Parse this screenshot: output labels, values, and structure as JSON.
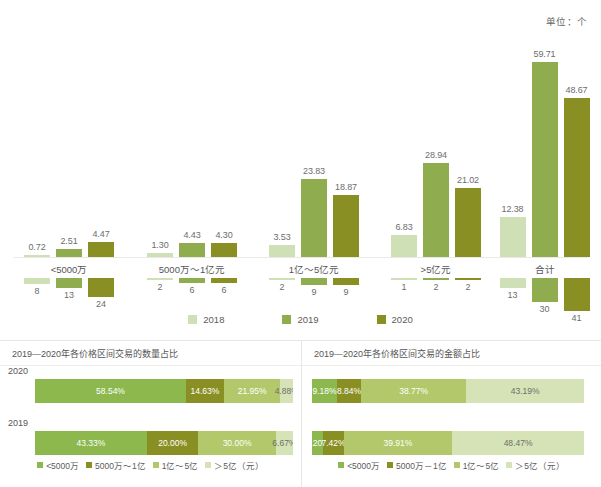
{
  "colors": {
    "c2018": "#cfdfb6",
    "c2019": "#8fad4e",
    "c2020": "#8a8f23",
    "seg_lt5000": "#8cb84e",
    "seg_5000_1yi": "#8a8f23",
    "seg_1_5yi": "#b3c86a",
    "seg_gt5yi": "#d6e3b6",
    "axis": "#e9eae6",
    "text": "#595959"
  },
  "top_chart": {
    "unit": "单位：个",
    "legend": [
      {
        "label": "2018",
        "color": "#cfdfb6"
      },
      {
        "label": "2019",
        "color": "#8fad4e"
      },
      {
        "label": "2020",
        "color": "#8a8f23"
      }
    ],
    "categories": [
      "<5000万",
      "5000万～1亿元",
      "1亿～5亿元",
      ">5亿元",
      "合计"
    ],
    "amount_series": [
      {
        "name": "2018",
        "values": [
          0.72,
          1.3,
          3.53,
          6.83,
          12.38
        ]
      },
      {
        "name": "2019",
        "values": [
          2.51,
          4.43,
          23.83,
          28.94,
          59.71
        ]
      },
      {
        "name": "2020",
        "values": [
          4.47,
          4.3,
          18.87,
          21.02,
          48.67
        ]
      }
    ],
    "count_series": [
      {
        "name": "2018",
        "values": [
          8,
          2,
          2,
          1,
          13
        ]
      },
      {
        "name": "2019",
        "values": [
          13,
          6,
          9,
          2,
          30
        ]
      },
      {
        "name": "2020",
        "values": [
          24,
          6,
          9,
          2,
          41
        ]
      }
    ],
    "amount_labels": [
      [
        "0.72",
        "2.51",
        "4.47"
      ],
      [
        "1.30",
        "4.43",
        "4.30"
      ],
      [
        "3.53",
        "23.83",
        "18.87"
      ],
      [
        "6.83",
        "28.94",
        "21.02"
      ],
      [
        "12.38",
        "59.71",
        "48.67"
      ]
    ],
    "count_labels": [
      [
        "8",
        "13",
        "24"
      ],
      [
        "2",
        "6",
        "6"
      ],
      [
        "2",
        "9",
        "9"
      ],
      [
        "1",
        "2",
        "2"
      ],
      [
        "13",
        "30",
        "41"
      ]
    ]
  },
  "panel_left": {
    "title": "2019—2020年各价格区间交易的数量占比",
    "rows": [
      {
        "year": "2020",
        "values": [
          58.54,
          14.63,
          21.95,
          4.88
        ],
        "labels": [
          "58.54%",
          "14.63%",
          "21.95%",
          "4.88%"
        ]
      },
      {
        "year": "2019",
        "values": [
          43.33,
          20.0,
          30.0,
          6.67
        ],
        "labels": [
          "43.33%",
          "20.00%",
          "30.00%",
          "6.67%"
        ]
      }
    ],
    "legend": [
      {
        "label": "<5000万",
        "color": "#8cb84e"
      },
      {
        "label": "5000万～1亿",
        "color": "#8a8f23"
      },
      {
        "label": "1亿～5亿",
        "color": "#b3c86a"
      },
      {
        "label": "＞5亿（元）",
        "color": "#d6e3b6"
      }
    ]
  },
  "panel_right": {
    "title": "2019—2020年各价格区间交易的金额占比",
    "rows": [
      {
        "year": "2020",
        "values": [
          9.18,
          8.84,
          38.77,
          43.19
        ],
        "labels": [
          "9.18%",
          "8.84%",
          "38.77%",
          "43.19%"
        ]
      },
      {
        "year": "2019",
        "values": [
          4.2,
          7.42,
          39.91,
          48.47
        ],
        "labels": [
          "4.20%",
          "7.42%",
          "39.91%",
          "48.47%"
        ]
      }
    ],
    "legend": [
      {
        "label": "<5000万",
        "color": "#8cb84e"
      },
      {
        "label": "5000万－1亿",
        "color": "#8a8f23"
      },
      {
        "label": "1亿～5亿",
        "color": "#b3c86a"
      },
      {
        "label": "＞5亿（元）",
        "color": "#d6e3b6"
      }
    ]
  },
  "chart_data": [
    {
      "type": "bar",
      "title": "各价格区间交易金额（单位：个）",
      "xlabel": "",
      "ylabel": "",
      "categories": [
        "<5000万",
        "5000万～1亿元",
        "1亿～5亿元",
        ">5亿元",
        "合计"
      ],
      "series": [
        {
          "name": "2018",
          "values": [
            0.72,
            1.3,
            3.53,
            6.83,
            12.38
          ]
        },
        {
          "name": "2019",
          "values": [
            2.51,
            4.43,
            23.83,
            28.94,
            59.71
          ]
        },
        {
          "name": "2020",
          "values": [
            4.47,
            4.3,
            18.87,
            21.02,
            48.67
          ]
        }
      ],
      "ylim": [
        0,
        60
      ],
      "grid": false,
      "legend_position": "bottom"
    },
    {
      "type": "bar",
      "title": "各价格区间交易数量（个）",
      "categories": [
        "<5000万",
        "5000万～1亿元",
        "1亿～5亿元",
        ">5亿元",
        "合计"
      ],
      "series": [
        {
          "name": "2018",
          "values": [
            8,
            2,
            2,
            1,
            13
          ]
        },
        {
          "name": "2019",
          "values": [
            13,
            6,
            9,
            2,
            30
          ]
        },
        {
          "name": "2020",
          "values": [
            24,
            6,
            9,
            2,
            41
          ]
        }
      ],
      "ylim": [
        0,
        41
      ],
      "grid": false,
      "legend_position": "bottom"
    },
    {
      "type": "bar",
      "title": "2019—2020年各价格区间交易的数量占比",
      "orientation": "horizontal",
      "stacked": true,
      "categories": [
        "2020",
        "2019"
      ],
      "series": [
        {
          "name": "<5000万",
          "values": [
            58.54,
            43.33
          ]
        },
        {
          "name": "5000万～1亿",
          "values": [
            14.63,
            20.0
          ]
        },
        {
          "name": "1亿～5亿",
          "values": [
            21.95,
            30.0
          ]
        },
        {
          "name": "＞5亿（元）",
          "values": [
            4.88,
            6.67
          ]
        }
      ],
      "xlim": [
        0,
        100
      ],
      "grid": false,
      "legend_position": "bottom"
    },
    {
      "type": "bar",
      "title": "2019—2020年各价格区间交易的金额占比",
      "orientation": "horizontal",
      "stacked": true,
      "categories": [
        "2020",
        "2019"
      ],
      "series": [
        {
          "name": "<5000万",
          "values": [
            9.18,
            4.2
          ]
        },
        {
          "name": "5000万－1亿",
          "values": [
            8.84,
            7.42
          ]
        },
        {
          "name": "1亿～5亿",
          "values": [
            38.77,
            39.91
          ]
        },
        {
          "name": "＞5亿（元）",
          "values": [
            43.19,
            48.47
          ]
        }
      ],
      "xlim": [
        0,
        100
      ],
      "grid": false,
      "legend_position": "bottom"
    }
  ]
}
